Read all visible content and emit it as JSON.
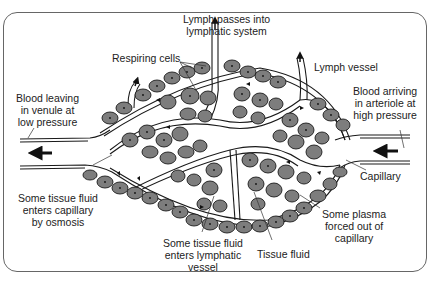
{
  "diagram": {
    "colors": {
      "cell_fill": "#7d7d7d",
      "line": "#1a1a1a",
      "background": "#ffffff",
      "frame": "#666666"
    },
    "labels": {
      "lymph_passes": "Lymph passes into\nlymphatic system",
      "lymph_passes_l1": "Lymph passes into",
      "lymph_passes_l2": "lymphatic system",
      "respiring_cells": "Respiring cells",
      "lymph_vessel": "Lymph vessel",
      "blood_leaving_l1": "Blood leaving",
      "blood_leaving_l2": "in venule at",
      "blood_leaving_l3": "low pressure",
      "blood_arriving_l1": "Blood arriving",
      "blood_arriving_l2": "in arteriole at",
      "blood_arriving_l3": "high pressure",
      "capillary": "Capillary",
      "osmosis_l1": "Some tissue fluid",
      "osmosis_l2": "enters capillary",
      "osmosis_l3": "by osmosis",
      "plasma_l1": "Some plasma",
      "plasma_l2": "forced out of",
      "plasma_l3": "capillary",
      "lymphatic_l1": "Some tissue fluid",
      "lymphatic_l2": "enters lymphatic",
      "lymphatic_l3": "vessel",
      "tissue_fluid": "Tissue fluid"
    },
    "icons": [
      "flow-arrow-left-venule",
      "flow-arrow-left-arteriole",
      "lymph-exit-arrow"
    ]
  }
}
